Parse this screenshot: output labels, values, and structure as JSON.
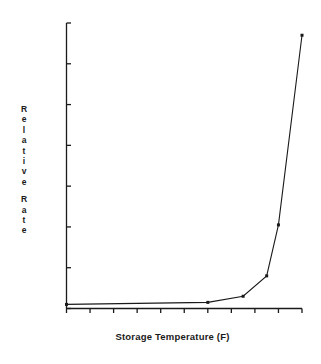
{
  "chart_data": {
    "type": "line",
    "title": "",
    "subtitle": "",
    "xlabel": "Storage Temperature (F)",
    "ylabel": "Relative Rate",
    "ylabel_chars": [
      "R",
      "e",
      "l",
      "a",
      "t",
      "i",
      "v",
      "e",
      "",
      "R",
      "a",
      "t",
      "e"
    ],
    "xlim": [
      -80,
      20
    ],
    "ylim": [
      0,
      140
    ],
    "xticks": [
      -80,
      -70,
      -60,
      -50,
      -40,
      -30,
      -20,
      -10,
      0,
      10,
      20
    ],
    "xtick_labels": [
      "-80",
      "-70",
      "-60",
      "-50",
      "-40",
      "-30",
      "-20",
      "-10",
      "0",
      "10",
      "20"
    ],
    "yticks": [
      0,
      20,
      40,
      60,
      80,
      100,
      120,
      140
    ],
    "ytick_labels": [
      "0",
      "20",
      "40",
      "60",
      "80",
      "100",
      "120",
      "140"
    ],
    "grid": false,
    "legend": false,
    "legend_position": "none",
    "line_color": "#1a1a1a",
    "marker": "square",
    "series": [
      {
        "name": "Relative Rate",
        "x": [
          -80,
          -20,
          -5,
          5,
          10,
          20
        ],
        "values": [
          2,
          3,
          6,
          16,
          41,
          134
        ]
      }
    ]
  },
  "colors": {
    "background": "#ffffff",
    "foreground": "#1a1a1a",
    "axis": "#1a1a1a"
  }
}
